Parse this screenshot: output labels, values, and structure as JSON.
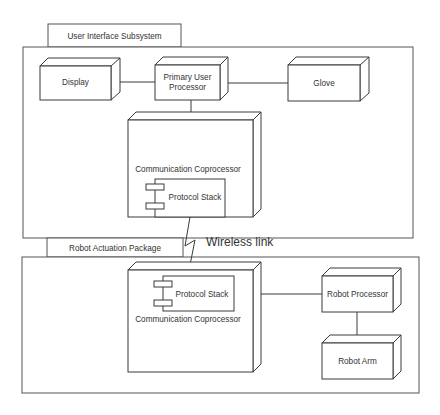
{
  "diagram": {
    "type": "UML deployment diagram",
    "packages": [
      {
        "id": "ui",
        "label": "User Interface Subsystem"
      },
      {
        "id": "robot",
        "label": "Robot Actuation Package"
      }
    ],
    "nodes": {
      "display": {
        "label": "Display"
      },
      "primary": {
        "label_line1": "Primary User",
        "label_line2": "Processor"
      },
      "glove": {
        "label": "Glove"
      },
      "comm_top": {
        "label": "Communication Coprocessor"
      },
      "comm_bottom": {
        "label": "Communication Coprocessor"
      },
      "robot_processor": {
        "label": "Robot Processor"
      },
      "robot_arm": {
        "label": "Robot Arm"
      }
    },
    "components": {
      "stack_top": {
        "label": "Protocol Stack"
      },
      "stack_bottom": {
        "label": "Protocol Stack"
      }
    },
    "links": [
      {
        "from": "display",
        "to": "primary"
      },
      {
        "from": "primary",
        "to": "glove"
      },
      {
        "from": "primary",
        "to": "comm_top"
      },
      {
        "from": "comm_top",
        "to": "comm_bottom",
        "label": "Wireless link"
      },
      {
        "from": "comm_bottom",
        "to": "robot_processor"
      },
      {
        "from": "robot_processor",
        "to": "robot_arm"
      }
    ],
    "wireless_label": "Wireless link"
  }
}
